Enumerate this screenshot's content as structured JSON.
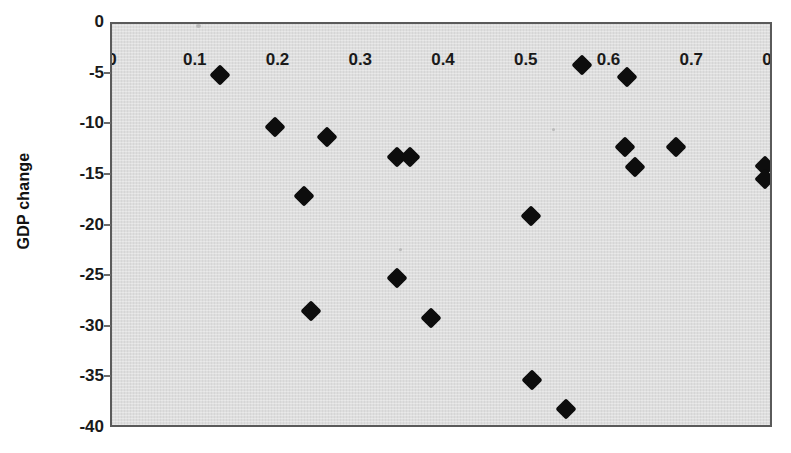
{
  "chart_data": {
    "type": "scatter",
    "title": "",
    "xlabel": "",
    "ylabel": "GDP change",
    "xlim": [
      0,
      0.8
    ],
    "ylim": [
      -40,
      0
    ],
    "grid": false,
    "legend": null,
    "x_ticks": [
      "0",
      "0.1",
      "0.2",
      "0.3",
      "0.4",
      "0.5",
      "0.6",
      "0.7",
      "0.8"
    ],
    "x_tick_values": [
      0,
      0.1,
      0.2,
      0.3,
      0.4,
      0.5,
      0.6,
      0.7,
      0.8
    ],
    "y_ticks": [
      "0",
      "-5",
      "-10",
      "-15",
      "-20",
      "-25",
      "-30",
      "-35",
      "-40"
    ],
    "y_tick_values": [
      0,
      -5,
      -10,
      -15,
      -20,
      -25,
      -30,
      -35,
      -40
    ],
    "marker": "diamond",
    "marker_color": "#0d0d0d",
    "plot_background": "#dcdcdc",
    "points": [
      {
        "x": 0.13,
        "y": -5.0
      },
      {
        "x": 0.197,
        "y": -10.2
      },
      {
        "x": 0.232,
        "y": -17.0
      },
      {
        "x": 0.24,
        "y": -28.3
      },
      {
        "x": 0.26,
        "y": -11.2
      },
      {
        "x": 0.344,
        "y": -25.1
      },
      {
        "x": 0.345,
        "y": -13.1
      },
      {
        "x": 0.36,
        "y": -13.1
      },
      {
        "x": 0.385,
        "y": -29.0
      },
      {
        "x": 0.506,
        "y": -19.0
      },
      {
        "x": 0.507,
        "y": -35.2
      },
      {
        "x": 0.549,
        "y": -38.0
      },
      {
        "x": 0.568,
        "y": -4.0
      },
      {
        "x": 0.622,
        "y": -5.2
      },
      {
        "x": 0.62,
        "y": -12.1
      },
      {
        "x": 0.632,
        "y": -14.1
      },
      {
        "x": 0.681,
        "y": -12.1
      },
      {
        "x": 0.789,
        "y": -14.0
      },
      {
        "x": 0.789,
        "y": -15.3
      }
    ]
  }
}
